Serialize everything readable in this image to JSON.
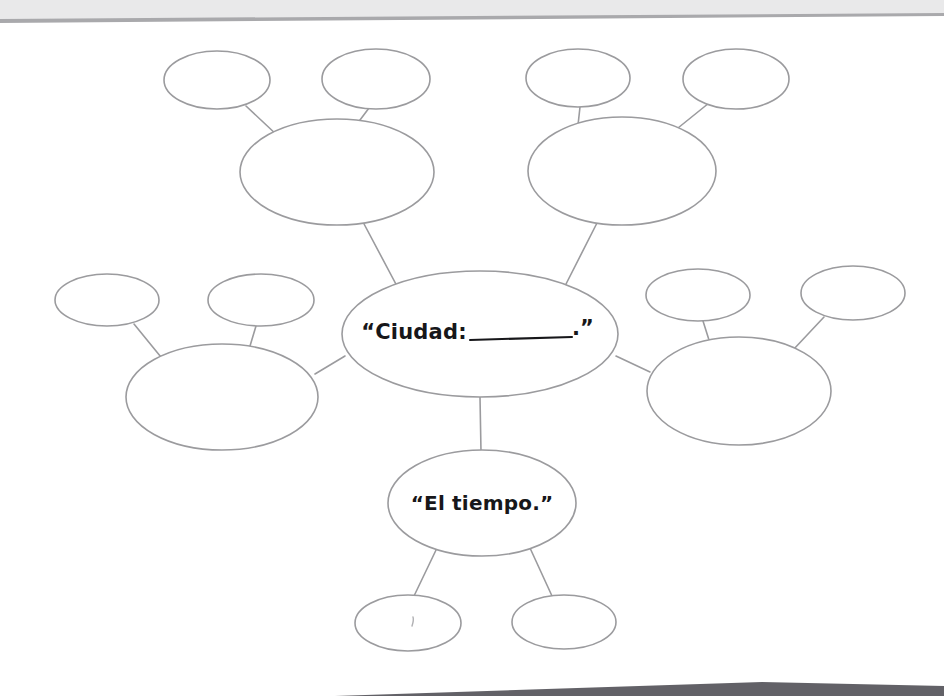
{
  "page": {
    "type": "worksheet-graphic-organizer",
    "background_color": "#ffffff",
    "width": 944,
    "height": 696
  },
  "scan_artifacts": {
    "top_band": {
      "name": "page-edge-band",
      "fill_color": "#e9e9ea",
      "line_color": "#a9a9ac",
      "left_y": 21,
      "right_y": 15
    },
    "bottom_shadow": {
      "name": "page-edge-shadow",
      "color": "#55545a",
      "start_x": 335,
      "end_x": 762
    }
  },
  "diagram": {
    "name": "bubble-map",
    "stroke_color": "#9b9b9e",
    "fill_color": "#ffffff",
    "center": {
      "label_prefix": "“Ciudad:",
      "label_suffix": ".”",
      "label_full": "“Ciudad: __________.”",
      "blank_line": true,
      "cx": 480,
      "cy": 334,
      "rx": 138,
      "ry": 63
    },
    "branches": [
      {
        "id": "branch-top-left",
        "position": "top-left",
        "label": "",
        "cx": 337,
        "cy": 172,
        "rx": 97,
        "ry": 53,
        "leaves": [
          {
            "id": "leaf-top-left-a",
            "label": "",
            "cx": 217,
            "cy": 80,
            "rx": 53,
            "ry": 29
          },
          {
            "id": "leaf-top-left-b",
            "label": "",
            "cx": 376,
            "cy": 79,
            "rx": 54,
            "ry": 30
          }
        ]
      },
      {
        "id": "branch-top-right",
        "position": "top-right",
        "label": "",
        "cx": 622,
        "cy": 171,
        "rx": 94,
        "ry": 54,
        "leaves": [
          {
            "id": "leaf-top-right-a",
            "label": "",
            "cx": 578,
            "cy": 78,
            "rx": 52,
            "ry": 29
          },
          {
            "id": "leaf-top-right-b",
            "label": "",
            "cx": 736,
            "cy": 79,
            "rx": 53,
            "ry": 30
          }
        ]
      },
      {
        "id": "branch-left",
        "position": "left",
        "label": "",
        "cx": 222,
        "cy": 397,
        "rx": 96,
        "ry": 53,
        "leaves": [
          {
            "id": "leaf-left-a",
            "label": "",
            "cx": 107,
            "cy": 300,
            "rx": 52,
            "ry": 26
          },
          {
            "id": "leaf-left-b",
            "label": "",
            "cx": 261,
            "cy": 300,
            "rx": 53,
            "ry": 26
          }
        ]
      },
      {
        "id": "branch-right",
        "position": "right",
        "label": "",
        "cx": 739,
        "cy": 391,
        "rx": 92,
        "ry": 54,
        "leaves": [
          {
            "id": "leaf-right-a",
            "label": "",
            "cx": 698,
            "cy": 295,
            "rx": 52,
            "ry": 26
          },
          {
            "id": "leaf-right-b",
            "label": "",
            "cx": 853,
            "cy": 293,
            "rx": 52,
            "ry": 27
          }
        ]
      },
      {
        "id": "branch-bottom",
        "position": "bottom",
        "label": "“El tiempo.”",
        "cx": 482,
        "cy": 503,
        "rx": 94,
        "ry": 53,
        "leaves": [
          {
            "id": "leaf-bottom-a",
            "label": "",
            "cx": 408,
            "cy": 623,
            "rx": 53,
            "ry": 28
          },
          {
            "id": "leaf-bottom-b",
            "label": "",
            "cx": 564,
            "cy": 622,
            "rx": 52,
            "ry": 27
          }
        ]
      }
    ]
  }
}
